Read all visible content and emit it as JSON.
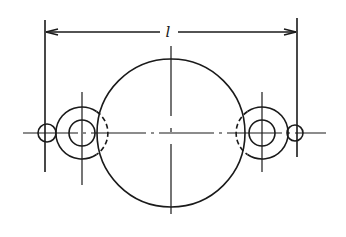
{
  "diagram": {
    "type": "engineering-drawing",
    "dimension_label": "l",
    "colors": {
      "stroke": "#1a1a1a",
      "background": "#ffffff"
    },
    "centerline_y": 133,
    "dimension": {
      "y": 32,
      "x1": 45,
      "x2": 297
    },
    "central_circle": {
      "cx": 171,
      "cy": 133,
      "r": 74
    },
    "left_ring": {
      "cx": 82,
      "cy": 133,
      "r_outer": 26,
      "r_inner": 13
    },
    "right_ring": {
      "cx": 262,
      "cy": 133,
      "r_outer": 26,
      "r_inner": 13
    },
    "left_end_circle": {
      "cx": 47,
      "cy": 133,
      "r": 9
    },
    "right_end_circle": {
      "cx": 295,
      "cy": 133,
      "r": 8
    }
  }
}
